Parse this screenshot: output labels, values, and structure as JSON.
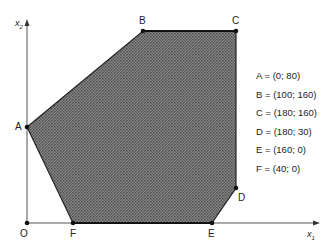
{
  "diagram": {
    "type": "feasible-region polygon",
    "axes": {
      "x_label": "x",
      "x_sub": "1",
      "y_label": "x",
      "y_sub": "2",
      "origin_label": "O"
    },
    "fill_color": "#6e6e6e",
    "points": [
      {
        "name": "A",
        "x": 0,
        "y": 80,
        "text": "A = (0; 80)"
      },
      {
        "name": "B",
        "x": 100,
        "y": 160,
        "text": "B = (100; 160)"
      },
      {
        "name": "C",
        "x": 180,
        "y": 160,
        "text": "C = (180; 160)"
      },
      {
        "name": "D",
        "x": 180,
        "y": 30,
        "text": "D = (180; 30)"
      },
      {
        "name": "E",
        "x": 160,
        "y": 0,
        "text": "E = (160; 0)"
      },
      {
        "name": "F",
        "x": 40,
        "y": 0,
        "text": "F = (40; 0)"
      }
    ]
  }
}
